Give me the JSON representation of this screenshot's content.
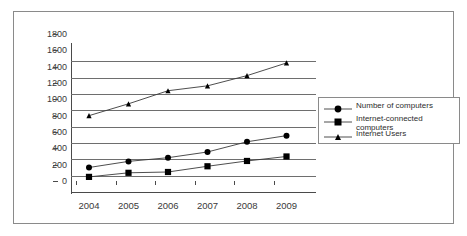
{
  "chart_data": {
    "type": "line",
    "title": "",
    "xlabel": "",
    "ylabel": "",
    "categories": [
      "2004",
      "2005",
      "2006",
      "2007",
      "2008",
      "2009"
    ],
    "x": [
      2004,
      2005,
      2006,
      2007,
      2008,
      2009
    ],
    "ylim": [
      0,
      1800
    ],
    "ytick_labels": [
      "1800",
      "1600",
      "1400",
      "1200",
      "1000",
      "800",
      "600",
      "400",
      "200",
      "0"
    ],
    "ytick_values": [
      1800,
      1600,
      1400,
      1200,
      1000,
      800,
      600,
      400,
      200,
      0
    ],
    "ytick_step": 200,
    "grid": "horizontal",
    "legend_position": "right",
    "line_color": "#3a3a3a",
    "marker_color": "#000000",
    "series": [
      {
        "name": "Number of computers",
        "marker": "diamond",
        "values": [
          300,
          375,
          420,
          490,
          615,
          690
        ]
      },
      {
        "name": "Internet-connected computers",
        "marker": "square",
        "values": [
          185,
          235,
          245,
          315,
          380,
          435
        ]
      },
      {
        "name": "Internet Users",
        "marker": "triangle",
        "values": [
          935,
          1080,
          1240,
          1300,
          1425,
          1580
        ]
      }
    ]
  },
  "legend": {
    "items": [
      {
        "label": "Number of computers",
        "marker": "diamond"
      },
      {
        "label": "Internet-connected computers",
        "marker": "square"
      },
      {
        "label": "Internet Users",
        "marker": "triangle"
      }
    ]
  }
}
